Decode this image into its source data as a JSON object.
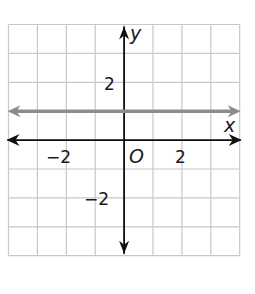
{
  "chart_data": {
    "type": "line",
    "title": "",
    "xlabel": "x",
    "ylabel": "y",
    "xlim": [
      -4,
      4
    ],
    "ylim": [
      -4,
      4
    ],
    "grid": true,
    "grid_step": 1,
    "origin_label": "O",
    "x_tick_labels": [
      {
        "value": -2,
        "label": "−2"
      },
      {
        "value": 2,
        "label": "2"
      }
    ],
    "y_tick_labels": [
      {
        "value": 2,
        "label": "2"
      },
      {
        "value": -2,
        "label": "−2"
      }
    ],
    "series": [
      {
        "name": "y = 1",
        "equation": "y = 1",
        "x": [
          -4,
          4
        ],
        "y": [
          1,
          1
        ],
        "color": "#8c8c8c",
        "arrows": "both"
      }
    ]
  },
  "colors": {
    "grid": "#c8c8c8",
    "axes": "#111111",
    "line": "#8c8c8c",
    "background": "#ffffff"
  }
}
